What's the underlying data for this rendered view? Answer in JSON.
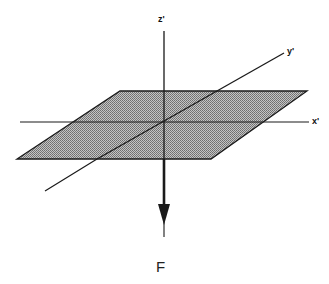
{
  "diagram": {
    "type": "3d-axes-with-plane-and-force",
    "axes": {
      "z": {
        "label": "z'"
      },
      "y": {
        "label": "y'"
      },
      "x": {
        "label": "x'"
      }
    },
    "plane": {
      "fill": "#a8a8a8",
      "pattern": "dotted-halftone"
    },
    "force": {
      "label": "F",
      "direction": "down (negative z')"
    },
    "colors": {
      "line": "#1a1a1a",
      "plane": "#a8a8a8",
      "background": "#ffffff"
    }
  }
}
